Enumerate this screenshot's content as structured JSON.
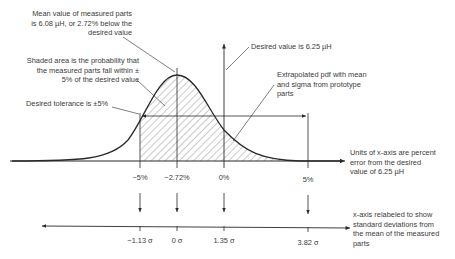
{
  "annotations": {
    "mean": [
      "Mean value of measured parts",
      "is 6.08 µH, or 2.72% below the",
      "desired value"
    ],
    "shaded": [
      "Shaded area is the probability that",
      "the measured parts fall within ±",
      "5% of the desired value"
    ],
    "tolerance": "Desired tolerance is ±5%",
    "desired": "Desired value is 6.25 µH",
    "pdf": [
      "Extrapolated pdf with mean",
      "and sigma from prototype",
      "parts"
    ],
    "units": [
      "Units of x-axis are percent",
      "error from the desired",
      "value of 6.25 µH"
    ],
    "relabel": [
      "x-axis relabeled to show",
      "standard deviations from",
      "the mean of the measured",
      "parts"
    ]
  },
  "percent_axis": {
    "ticks": [
      {
        "label": "−5%",
        "x": 140
      },
      {
        "label": "−2.72%",
        "x": 177
      },
      {
        "label": "0%",
        "x": 224
      },
      {
        "label": "5%",
        "x": 308
      }
    ]
  },
  "sigma_axis": {
    "ticks": [
      {
        "label": "−1.13 σ",
        "x": 140
      },
      {
        "label": "0 σ",
        "x": 177
      },
      {
        "label": "1.35 σ",
        "x": 224
      },
      {
        "label": "3.82 σ",
        "x": 308
      }
    ]
  },
  "colors": {
    "line": "#2a2a2a",
    "hatch": "#555555",
    "text": "#3a3a3a"
  }
}
